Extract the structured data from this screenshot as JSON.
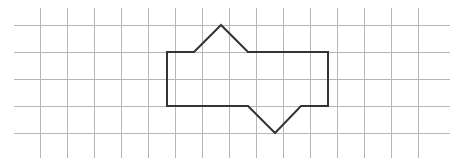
{
  "figure": {
    "canvas": {
      "width": 462,
      "height": 165,
      "background": "#ffffff"
    },
    "grid": {
      "name": "graph-paper-grid",
      "spacing": 27,
      "color": "#b6b6b6",
      "line_width": 1,
      "vertical_lines_x": [
        40,
        67,
        94,
        121,
        148,
        175,
        202,
        229,
        256,
        283,
        310,
        337,
        364,
        391,
        418
      ],
      "horizontal_lines_y": [
        25,
        52,
        79,
        106,
        133
      ],
      "vertical_extent_y": [
        8,
        158
      ],
      "horizontal_extent_x": [
        14,
        450
      ]
    },
    "shape": {
      "name": "notched-hexagon-polygon",
      "stroke_color": "#333333",
      "stroke_width": 2,
      "fill": "none",
      "closed": true,
      "vertex_count": 10,
      "vertices": [
        {
          "label": "top-left-corner",
          "x": 167,
          "y": 52
        },
        {
          "label": "peak-left-base",
          "x": 194,
          "y": 52
        },
        {
          "label": "apex",
          "x": 221,
          "y": 25
        },
        {
          "label": "peak-right-base",
          "x": 248,
          "y": 52
        },
        {
          "label": "top-right-corner",
          "x": 328,
          "y": 52
        },
        {
          "label": "bottom-right-corner",
          "x": 328,
          "y": 106
        },
        {
          "label": "notch-right-top",
          "x": 301,
          "y": 106
        },
        {
          "label": "notch-bottom",
          "x": 275,
          "y": 133
        },
        {
          "label": "notch-left-top",
          "x": 248,
          "y": 106
        },
        {
          "label": "bottom-left-corner",
          "x": 167,
          "y": 106
        }
      ],
      "path": "M 167 52 L 194 52 L 221 25 L 248 52 L 328 52 L 328 106 L 301 106 L 275 133 L 248 106 L 167 106 Z"
    }
  }
}
